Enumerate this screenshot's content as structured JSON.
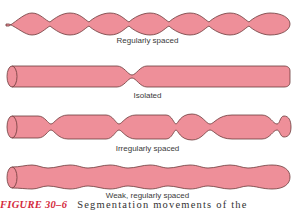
{
  "figure": {
    "colors": {
      "fill": "#ee8f99",
      "stroke": "#6b3a3a",
      "caption_number": "#d42a3c"
    },
    "panels": [
      {
        "label": "Regularly spaced"
      },
      {
        "label": "Isolated"
      },
      {
        "label": "Irregularly spaced"
      },
      {
        "label": "Weak, regularly spaced"
      }
    ],
    "caption": {
      "number": "FIGURE 30–6",
      "text": "Segmentation movements of the"
    }
  }
}
